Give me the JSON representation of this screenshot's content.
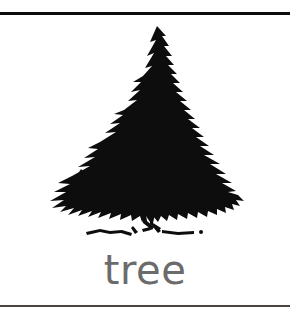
{
  "card": {
    "name": "picture-word-flashcard",
    "background_color": "#ffffff"
  },
  "rules": {
    "top_rule_color": "#0d0d0d",
    "bottom_rule_color": "#3a342f"
  },
  "illustration": {
    "icon_name": "pine-tree-drawing",
    "subject": "tree",
    "style": "hand-drawn black ink line art",
    "ink_color": "#0d0d0d",
    "fill_color": "#ffffff"
  },
  "caption": {
    "text": "tree",
    "color": "#6b6b6b"
  }
}
